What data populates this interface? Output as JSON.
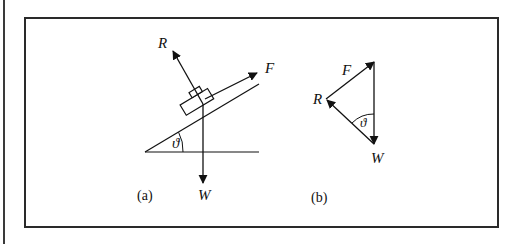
{
  "figure": {
    "panel_a": {
      "caption": "(a)",
      "labels": {
        "reaction": "R",
        "force": "F",
        "weight": "W",
        "angle": "ϑ"
      },
      "description": "Block on inclined plane with forces R (normal), F (along slope), W (weight)"
    },
    "panel_b": {
      "caption": "(b)",
      "labels": {
        "force": "F",
        "reaction": "R",
        "weight": "W",
        "angle": "ϑ"
      },
      "description": "Triangle of forces F, R, W"
    }
  },
  "colors": {
    "ink": "#111111",
    "frame": "#2a2a2a",
    "background": "#ffffff"
  }
}
